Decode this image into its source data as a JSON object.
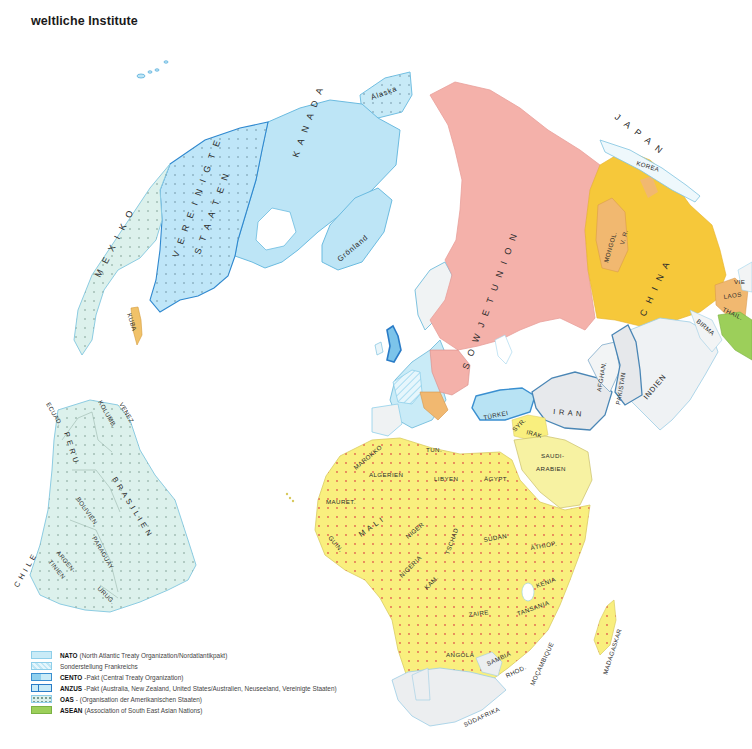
{
  "title": "weltliche Institute",
  "colors": {
    "nato": "#c9ebf7",
    "nato_border": "#62b8e0",
    "france_special": "#dff3fb",
    "cento": "#b8e3f4",
    "cento_border": "#3a8fd0",
    "anzus_border": "#2a7cc7",
    "oas": "#def2ee",
    "asean": "#9ccf5a",
    "warsaw_pact_ussr": "#f4b1aa",
    "china": "#f6c83a",
    "mongolia": "#f1b870",
    "oau_africa": "#f9ef7e",
    "arab_league": "#f6f1a0",
    "neutral": "#eceef0",
    "cuba": "#f1c269",
    "coast": "#8ecfe9"
  },
  "map": {
    "countries": {
      "alaska": "Alaska",
      "kanada": "K A N A D A",
      "vereinigte": "V E R E I N I G T E",
      "staaten": "S T A A T E N",
      "groenland": "Grönland",
      "mexiko": "M E X I K O",
      "kuba": "KUBA",
      "sowjetunion": "S O W J E T U N I O N",
      "japan": "J A P A N",
      "korea": "KOREA",
      "mongol": "MONGOL.",
      "vr": "V. R.",
      "china": "C H I N A",
      "vie": "VIE",
      "laos": "LAOS",
      "thail": "THAIL.",
      "birma": "BIRMA",
      "indien": "INDIEN",
      "pakistan": "PAKISTAN",
      "afghan": "AFGHAN.",
      "iran": "I R A N",
      "tuerkei": "TÜRKEI",
      "syr": "SYR.",
      "irak": "IRAK",
      "saudi": "SAUDI-",
      "arabien": "ARABIEN",
      "marokko": "MAROKKO",
      "tun": "TUN.",
      "algerien": "ALGERIEN",
      "libyen": "LIBYEN",
      "aegypt": "ÄGYPT.",
      "mauret": "MAURET.",
      "mali": "M A L I",
      "niger": "NIGER",
      "guin": "GUIN.",
      "nigeria": "NIGERIA",
      "tschad": "TSCHAD",
      "kam": "KAM.",
      "sudan": "SUDAN",
      "aethiop": "ÄTHIOP.",
      "kenia": "KENIA",
      "zaire": "ZAIRE",
      "tansania": "TANSANIA",
      "angola": "ANGOLA",
      "sambia": "SAMBIA",
      "rhod": "RHOD.",
      "mocambique": "MOÇAMBIQUE",
      "suedafrika": "SÜDAFRIKA",
      "madagaskar": "MADAGASKAR",
      "ecuad": "ECUAD.",
      "kolumb": "KOLUMB.",
      "venez": "VENEZ.",
      "peru": "P E R U",
      "brasilien": "B R A S I L I E N",
      "bolivien": "BOLIVIEN",
      "paraguay": "PARAGUAY",
      "chile": "C H I L E",
      "argen": "ARGEN-",
      "tinien": "TINIEN",
      "urug": "URUG."
    }
  },
  "legend": {
    "items": [
      {
        "abbr": "NATO",
        "text": "(North Atlantic Treaty Organization/Nordatlantikpakt)",
        "swatch": "nato"
      },
      {
        "abbr": "",
        "text": "Sonderstellung Frankreichs",
        "swatch": "france"
      },
      {
        "abbr": "CENTO",
        "text": "-Pakt (Central Treaty Organization)",
        "swatch": "cento"
      },
      {
        "abbr": "ANZUS",
        "text": "-Pakt (Australia, New Zealand, United States/Australien, Neuseeland, Vereinigte Staaten)",
        "swatch": "anzus"
      },
      {
        "abbr": "OAS",
        "text": "- (Organisation der Amerikanischen Staaten)",
        "swatch": "oas"
      },
      {
        "abbr": "ASEAN",
        "text": "(Association of South East Asian Nations)",
        "swatch": "asean"
      }
    ]
  }
}
